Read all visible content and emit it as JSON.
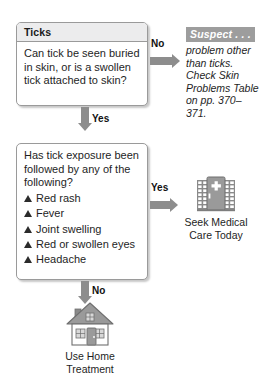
{
  "flowchart": {
    "nodes": {
      "ticks_question": {
        "header": "Ticks",
        "question": "Can tick be seen buried in skin, or is a swollen tick attached to skin?"
      },
      "symptom_question": {
        "question": "Has tick exposure been followed by any of the following?",
        "symptoms": [
          "Red rash",
          "Fever",
          "Joint swelling",
          "Red or swollen eyes",
          "Headache"
        ]
      }
    },
    "connectors": {
      "ticks_no": "No",
      "ticks_yes": "Yes",
      "symptom_yes": "Yes",
      "symptom_no": "No"
    },
    "outcomes": {
      "suspect": {
        "header": "Suspect . . .",
        "body": "problem other than ticks. Check Skin Problems Table on pp. 370–371."
      },
      "hospital": {
        "icon": "hospital-icon",
        "caption_line1": "Seek Medical",
        "caption_line2": "Care Today"
      },
      "home": {
        "icon": "house-icon",
        "caption_line1": "Use Home",
        "caption_line2": "Treatment"
      }
    },
    "colors": {
      "connector_gray": "#8d8d8d",
      "header_band_gray": "#ececed",
      "suspect_band_gray": "#9d9d9d",
      "icon_gray": "#8a8a8a",
      "box_border": "#9a9a9a",
      "text": "#1e1e1e"
    }
  }
}
